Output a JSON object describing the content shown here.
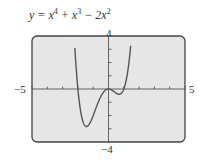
{
  "chart_data": {
    "type": "line",
    "function": "x^4 + x^3 - 2x^2",
    "xlim": [
      -5,
      5
    ],
    "ylim": [
      -4,
      4
    ],
    "x_tick_labels": {
      "min": "-5",
      "max": "5"
    },
    "y_tick_labels": {
      "min": "-4",
      "max": "4"
    },
    "x_ticks": [
      -5,
      -4,
      -3,
      -2,
      -1,
      0,
      1,
      2,
      3,
      4,
      5
    ],
    "y_ticks": [
      -4,
      -3,
      -2,
      -1,
      0,
      1,
      2,
      3,
      4
    ],
    "grid": false,
    "x": [
      -2.2,
      -2.1,
      -2.0,
      -1.9,
      -1.8,
      -1.7,
      -1.6,
      -1.5,
      -1.4,
      -1.3,
      -1.2,
      -1.1,
      -1.0,
      -0.9,
      -0.8,
      -0.7,
      -0.6,
      -0.5,
      -0.4,
      -0.3,
      -0.2,
      -0.1,
      0,
      0.1,
      0.2,
      0.3,
      0.4,
      0.5,
      0.6,
      0.7,
      0.8,
      0.9,
      1.0,
      1.1,
      1.2,
      1.3,
      1.4
    ],
    "y": [
      3.15,
      1.36,
      0,
      -0.97,
      -1.6,
      -1.93,
      -2.0,
      -1.83,
      -1.49,
      -1.01,
      -0.47,
      0.08,
      -2.0,
      -1.7,
      -1.35,
      -0.98,
      -0.67,
      -0.44,
      -0.24,
      -0.17,
      -0.08,
      -0.02,
      0,
      -0.02,
      -0.07,
      -0.15,
      -0.23,
      -0.31,
      -0.37,
      -0.4,
      -0.38,
      -0.29,
      0,
      0.27,
      0.66,
      1.19,
      1.88
    ],
    "key_points": {
      "local_min_left": [
        -1.44,
        -2.83
      ],
      "local_max": [
        0,
        0
      ],
      "local_min_right": [
        0.69,
        -0.4
      ]
    }
  },
  "labels": {
    "title_prefix": "y = x",
    "exp1": "4",
    "plus_x": " + x",
    "exp2": "3",
    "minus_2x": " − 2x",
    "exp3": "2",
    "y_max": "4",
    "y_min": "−4",
    "x_min": "−5",
    "x_max": "5"
  }
}
